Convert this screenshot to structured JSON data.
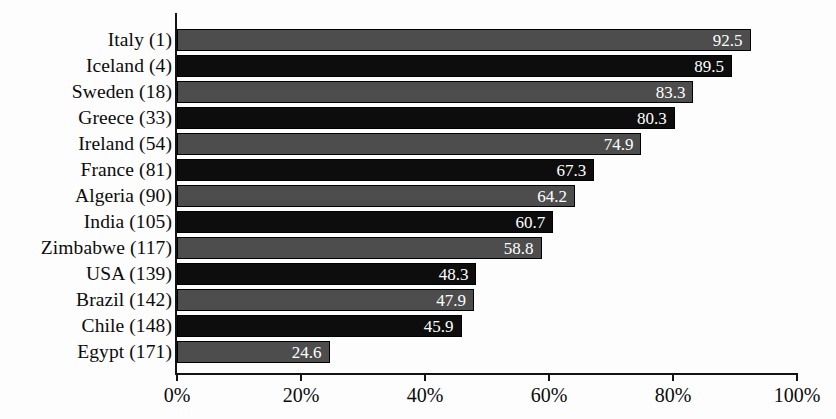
{
  "chart_data": {
    "type": "bar",
    "orientation": "horizontal",
    "title": "",
    "subtitle": "",
    "xlabel": "",
    "ylabel": "",
    "xlim": [
      0,
      100
    ],
    "grid": false,
    "legend": null,
    "axis_ticks": [
      "0%",
      "20%",
      "40%",
      "60%",
      "80%",
      "100%"
    ],
    "axis_tick_values": [
      0,
      20,
      40,
      60,
      80,
      100
    ],
    "value_label_format": "one-decimal",
    "categories": [
      "Italy (1)",
      "Iceland (4)",
      "Sweden (18)",
      "Greece (33)",
      "Ireland (54)",
      "France (81)",
      "Algeria (90)",
      "India (105)",
      "Zimbabwe (117)",
      "USA (139)",
      "Brazil (142)",
      "Chile (148)",
      "Egypt (171)"
    ],
    "values": [
      92.5,
      89.5,
      83.3,
      80.3,
      74.9,
      67.3,
      64.2,
      60.7,
      58.8,
      48.3,
      47.9,
      45.9,
      24.6
    ],
    "value_labels": [
      "92.5",
      "89.5",
      "83.3",
      "80.3",
      "74.9",
      "67.3",
      "64.2",
      "60.7",
      "58.8",
      "48.3",
      "47.9",
      "45.9",
      "24.6"
    ],
    "bar_tones": [
      "gray",
      "black",
      "gray",
      "black",
      "gray",
      "black",
      "gray",
      "black",
      "gray",
      "black",
      "gray",
      "black",
      "gray"
    ],
    "colors": {
      "bar_gray": "#4d4d4d",
      "bar_black": "#0d0d0d",
      "bar_outline": "#000000",
      "value_label_text": "#ffffff",
      "axis": "#131313",
      "category_text": "#0b0b0b",
      "background": "#fdfdfd"
    }
  }
}
